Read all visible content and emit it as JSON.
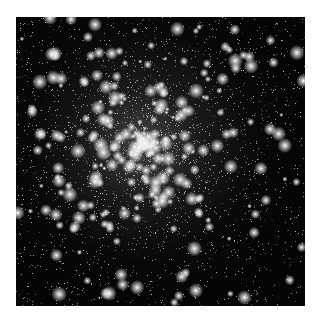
{
  "image": {
    "subject": "globular star cluster",
    "alt": "Dense field of white stars against a black background, concentrated toward the center",
    "colors": {
      "background": "#050505",
      "stars": "#ffffff",
      "page": "#ffffff"
    },
    "cluster_center": {
      "x_frac": 0.44,
      "y_frac": 0.44
    }
  }
}
